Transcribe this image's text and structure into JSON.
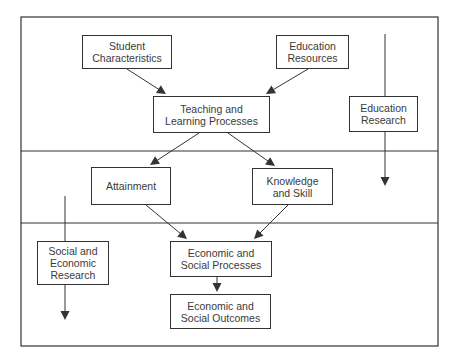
{
  "diagram": {
    "frame": {
      "x": 21,
      "y": 17,
      "w": 417,
      "h": 329,
      "dividers": [
        151,
        223
      ]
    },
    "stroke_color": "#333333",
    "nodes": [
      {
        "id": "student",
        "label": "Student\nCharacteristics",
        "x": 82,
        "y": 35,
        "w": 90,
        "h": 34
      },
      {
        "id": "resources",
        "label": "Education\nResources",
        "x": 276,
        "y": 35,
        "w": 73,
        "h": 34
      },
      {
        "id": "teaching",
        "label": "Teaching and\nLearning Processes",
        "x": 153,
        "y": 96,
        "w": 117,
        "h": 37
      },
      {
        "id": "edresearch",
        "label": "Education\nResearch",
        "x": 349,
        "y": 96,
        "w": 69,
        "h": 36
      },
      {
        "id": "attainment",
        "label": "Attainment",
        "x": 91,
        "y": 167,
        "w": 80,
        "h": 38
      },
      {
        "id": "knowledge",
        "label": "Knowledge\nand Skill",
        "x": 252,
        "y": 168,
        "w": 81,
        "h": 37
      },
      {
        "id": "socresearch",
        "label": "Social and\nEconomic\nResearch",
        "x": 37,
        "y": 241,
        "w": 72,
        "h": 44
      },
      {
        "id": "processes",
        "label": "Economic and\nSocial Processes",
        "x": 170,
        "y": 241,
        "w": 102,
        "h": 36
      },
      {
        "id": "outcomes",
        "label": "Economic and\nSocial Outcomes",
        "x": 170,
        "y": 294,
        "w": 101,
        "h": 35
      }
    ],
    "edges": [
      {
        "from": "student",
        "to": "teaching",
        "x1": 127,
        "y1": 69,
        "x2": 166,
        "y2": 94
      },
      {
        "from": "resources",
        "to": "teaching",
        "x1": 308,
        "y1": 69,
        "x2": 266,
        "y2": 94
      },
      {
        "from": "teaching",
        "to": "attainment",
        "x1": 199,
        "y1": 133,
        "x2": 150,
        "y2": 165
      },
      {
        "from": "teaching",
        "to": "knowledge",
        "x1": 228,
        "y1": 133,
        "x2": 275,
        "y2": 166
      },
      {
        "from": "attainment",
        "to": "processes",
        "x1": 146,
        "y1": 205,
        "x2": 187,
        "y2": 239
      },
      {
        "from": "knowledge",
        "to": "processes",
        "x1": 288,
        "y1": 205,
        "x2": 254,
        "y2": 239
      },
      {
        "from": "processes",
        "to": "outcomes",
        "x1": 217,
        "y1": 277,
        "x2": 217,
        "y2": 292
      }
    ],
    "research_lines": [
      {
        "id": "education-research-line",
        "x": 385,
        "y1": 34,
        "y2": 186,
        "through": "edresearch"
      },
      {
        "id": "social-research-line",
        "x": 65,
        "y1": 196,
        "y2": 320,
        "through": "socresearch"
      }
    ]
  }
}
